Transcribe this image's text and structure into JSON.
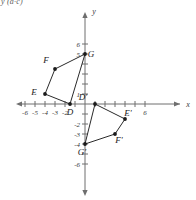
{
  "figure": {
    "corner_note": "y (a·c)",
    "axis_labels": {
      "x": "x",
      "y": "y"
    },
    "x_ticks": [
      {
        "value": -6,
        "label": "-6"
      },
      {
        "value": -5,
        "label": "-5"
      },
      {
        "value": -4,
        "label": "-4"
      },
      {
        "value": -3,
        "label": "-3"
      },
      {
        "value": -2,
        "label": "-2"
      },
      {
        "value": -1,
        "label": ""
      },
      {
        "value": 1,
        "label": ""
      },
      {
        "value": 2,
        "label": ""
      },
      {
        "value": 3,
        "label": ""
      },
      {
        "value": 4,
        "label": ""
      },
      {
        "value": 5,
        "label": ""
      },
      {
        "value": 6,
        "label": "6"
      }
    ],
    "y_ticks": [
      {
        "value": 6,
        "label": "6"
      },
      {
        "value": 5,
        "label": "5"
      },
      {
        "value": 4,
        "label": ""
      },
      {
        "value": 3,
        "label": ""
      },
      {
        "value": 2,
        "label": ""
      },
      {
        "value": 1,
        "label": "1"
      },
      {
        "value": -1,
        "label": ""
      },
      {
        "value": -2,
        "label": "-2"
      },
      {
        "value": -3,
        "label": "-3"
      },
      {
        "value": -4,
        "label": "-4"
      },
      {
        "value": -5,
        "label": ""
      },
      {
        "value": -6,
        "label": "-6"
      }
    ],
    "colors": {
      "axis": "#6e6e6e",
      "shape_stroke": "#2a2a2a",
      "vertex": "#1a1a1a",
      "text": "#3a3a3a"
    },
    "polygons": [
      {
        "name": "preimage-DEFG",
        "vertices": [
          {
            "label": "D",
            "x": -1.5,
            "y": 0,
            "label_dx": 0,
            "label_dy": 11
          },
          {
            "label": "E",
            "x": -4,
            "y": 1,
            "label_dx": -11,
            "label_dy": 1
          },
          {
            "label": "F",
            "x": -3,
            "y": 3.5,
            "label_dx": -9,
            "label_dy": -6
          },
          {
            "label": "G",
            "x": 0,
            "y": 5,
            "label_dx": 6,
            "label_dy": 3
          }
        ]
      },
      {
        "name": "image-DEFG-prime",
        "vertices": [
          {
            "label": "D'",
            "x": 1,
            "y": 0,
            "label_dx": -12,
            "label_dy": -4
          },
          {
            "label": "E'",
            "x": 4,
            "y": -1.5,
            "label_dx": 3,
            "label_dy": -3
          },
          {
            "label": "F'",
            "x": 3,
            "y": -3,
            "label_dx": 4,
            "label_dy": 9
          },
          {
            "label": "G'",
            "x": 0,
            "y": -4,
            "label_dx": -3,
            "label_dy": 11
          }
        ]
      }
    ]
  }
}
